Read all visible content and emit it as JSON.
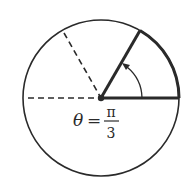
{
  "diagram": {
    "label": {
      "variable": "θ",
      "equals": "=",
      "numerator": "π",
      "denominator": "3"
    },
    "circle": {
      "cx": 101,
      "cy": 98,
      "r": 78
    },
    "angle_degrees": 60,
    "colors": {
      "stroke": "#2a2a2a",
      "background": "#ffffff"
    }
  }
}
